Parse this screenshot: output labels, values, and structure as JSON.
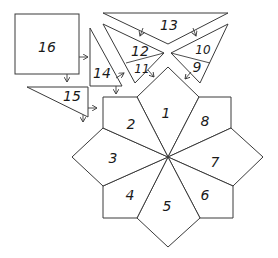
{
  "diagram": {
    "type": "quilt-pattern-piece-layout",
    "center_star": {
      "pieces": [
        {
          "label": "1",
          "position": "top"
        },
        {
          "label": "2",
          "position": "upper-left"
        },
        {
          "label": "3",
          "position": "left"
        },
        {
          "label": "4",
          "position": "lower-left"
        },
        {
          "label": "5",
          "position": "bottom"
        },
        {
          "label": "6",
          "position": "lower-right"
        },
        {
          "label": "7",
          "position": "right"
        },
        {
          "label": "8",
          "position": "upper-right"
        }
      ]
    },
    "upper_pieces": [
      {
        "label": "13",
        "shape": "inverted triangle"
      },
      {
        "label": "12",
        "shape": "triangle section (left wing)"
      },
      {
        "label": "11",
        "shape": "triangle section (left wing)"
      },
      {
        "label": "10",
        "shape": "triangle section (right wing)"
      },
      {
        "label": "9",
        "shape": "triangle section (right wing)"
      }
    ],
    "left_pieces": [
      {
        "label": "16",
        "shape": "square"
      },
      {
        "label": "14",
        "shape": "right triangle"
      },
      {
        "label": "15",
        "shape": "right triangle"
      }
    ],
    "stroke_color": "#3a3a3a",
    "background_color": "#ffffff"
  }
}
